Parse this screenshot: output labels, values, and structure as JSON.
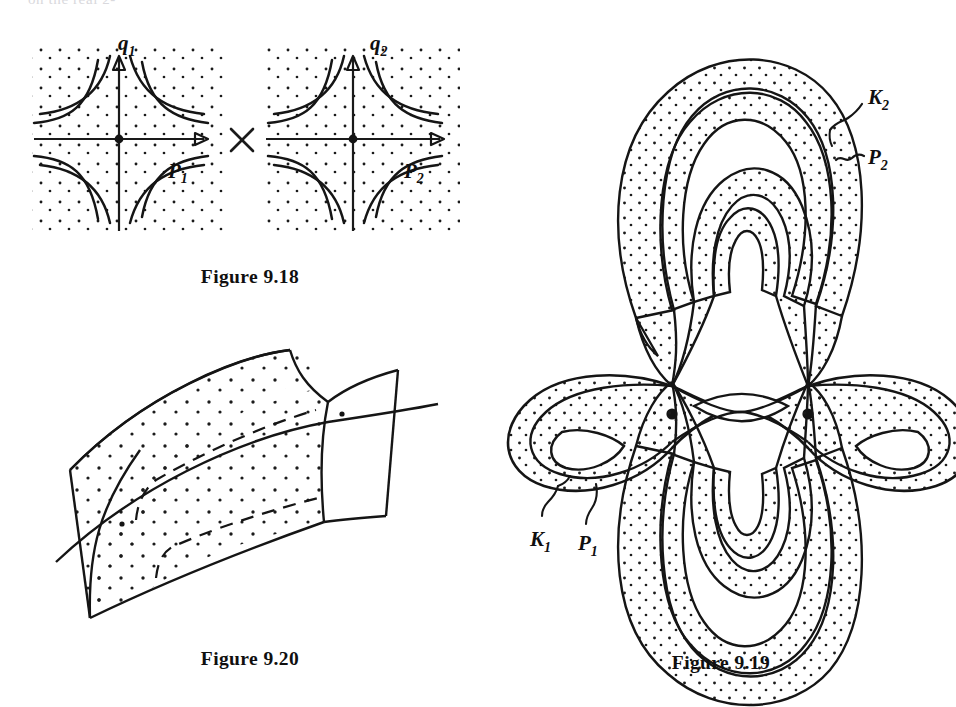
{
  "page": {
    "background": "#ffffff",
    "ink": "#151515",
    "cropped_top_text": "on the real 2-"
  },
  "figures": [
    {
      "id": "fig-9-18",
      "caption": "Figure 9.18",
      "type": "phase-portrait-product",
      "operator": "×",
      "panels": [
        {
          "name": "left-panel",
          "vertical_axis_label": "q",
          "vertical_axis_sub": "1",
          "horizontal_axis_label": "P",
          "horizontal_axis_sub": "1",
          "saddle_point": true,
          "shading": "stipple"
        },
        {
          "name": "right-panel",
          "vertical_axis_label": "q",
          "vertical_axis_sub": "2",
          "horizontal_axis_label": "P",
          "horizontal_axis_sub": "2",
          "saddle_point": true,
          "shading": "stipple"
        }
      ]
    },
    {
      "id": "fig-9-20",
      "caption": "Figure 9.20",
      "type": "intersecting-surfaces",
      "description": "two stippled ribbon surfaces crossing transversally",
      "hidden_lines": "dashed",
      "shading": "stipple"
    },
    {
      "id": "fig-9-19",
      "caption": "Figure 9.19",
      "type": "banded-separatrix-diagram",
      "shading": "stipple",
      "nodes": 2,
      "labels": [
        {
          "text": "K",
          "sub": "2",
          "prefix": "",
          "leader": "brace"
        },
        {
          "text": "P",
          "sub": "2",
          "prefix": "~",
          "leader": "tilde"
        },
        {
          "text": "K",
          "sub": "1",
          "prefix": "",
          "leader": "brace"
        },
        {
          "text": "P",
          "sub": "1",
          "prefix": "",
          "leader": "brace"
        }
      ]
    }
  ]
}
